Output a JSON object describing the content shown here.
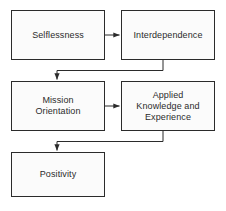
{
  "diagram": {
    "type": "flowchart",
    "background_color": "#ffffff",
    "box_fill_color": "#fbfbfb",
    "box_border_color": "#2b2b2b",
    "connector_color": "#2b2b2b",
    "text_color": "#2b2b2b",
    "nodes": [
      {
        "id": "selflessness",
        "label": "Selflessness",
        "x": 11,
        "y": 10,
        "width": 94,
        "height": 50
      },
      {
        "id": "interdependence",
        "label": "Interdependence",
        "x": 121,
        "y": 10,
        "width": 94,
        "height": 50
      },
      {
        "id": "mission-orientation",
        "label": "Mission\nOrientation",
        "x": 11,
        "y": 81,
        "width": 94,
        "height": 50
      },
      {
        "id": "applied-knowledge-and-experience",
        "label": "Applied\nKnowledge and\nExperience",
        "x": 121,
        "y": 81,
        "width": 94,
        "height": 50
      },
      {
        "id": "positivity",
        "label": "Positivity",
        "x": 11,
        "y": 152,
        "width": 94,
        "height": 45
      }
    ],
    "connectors": [
      {
        "id": "selflessness-to-interdependence",
        "from": "selflessness",
        "to": "interdependence",
        "style": "straight-horizontal",
        "direction": "right"
      },
      {
        "id": "interdependence-to-mission-orientation",
        "from": "interdependence",
        "to": "mission-orientation",
        "style": "elbow",
        "direction": "down"
      },
      {
        "id": "mission-orientation-to-applied-knowledge",
        "from": "mission-orientation",
        "to": "applied-knowledge-and-experience",
        "style": "straight-horizontal",
        "direction": "right"
      },
      {
        "id": "applied-knowledge-to-positivity",
        "from": "applied-knowledge-and-experience",
        "to": "positivity",
        "style": "elbow",
        "direction": "down"
      }
    ]
  }
}
